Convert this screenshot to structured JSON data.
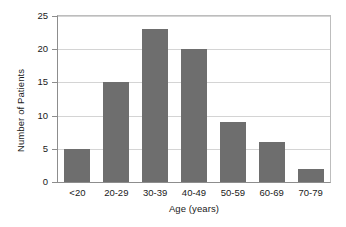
{
  "chart_data": {
    "type": "bar",
    "title": "",
    "xlabel": "Age (years)",
    "ylabel": "Number of Patients",
    "categories": [
      "<20",
      "20-29",
      "30-39",
      "40-49",
      "50-59",
      "60-69",
      "70-79"
    ],
    "values": [
      5,
      15,
      23,
      20,
      9,
      6,
      2
    ],
    "ylim": [
      0,
      25
    ],
    "yticks": [
      0,
      5,
      10,
      15,
      20,
      25
    ],
    "ytick_labels": [
      "0",
      "5",
      "10",
      "15",
      "20",
      "25"
    ],
    "grid": "horizontal",
    "legend": "none",
    "bar_color": "#6e6e6e",
    "axis_color": "#8d8d8d",
    "grid_color": "#d4d4d4",
    "background_color": "#ffffff",
    "text_color": "#1a1a1a",
    "series": [
      {
        "name": "Number of Patients",
        "values": [
          5,
          15,
          23,
          20,
          9,
          6,
          2
        ]
      }
    ]
  }
}
